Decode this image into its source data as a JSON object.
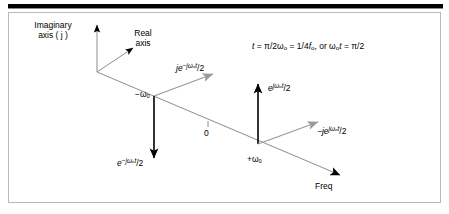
{
  "figure": {
    "title_bar": "",
    "axes": {
      "imaginary_axis_line1": "Imaginary",
      "imaginary_axis_line2": "axis ( j )",
      "real_axis_line1": "Real",
      "real_axis_line2": "axis",
      "freq_axis_label": "Freq"
    },
    "annotation": {
      "equation": "t = π/2ωₒ = 1/4fₒ, or ωₒt = π/2",
      "eq_part_1": "t",
      "eq_part_2": " = π/2ω",
      "eq_sub_1": "o",
      "eq_part_3": " = 1/4",
      "eq_part_4": "f",
      "eq_sub_2": "o",
      "eq_part_5": ", or  ω",
      "eq_sub_3": "o",
      "eq_part_6": "t",
      "eq_part_7": " = π/2"
    },
    "points": {
      "origin_label": "0",
      "negative_freq_label": "−ωₒ",
      "positive_freq_label": "+ωₒ"
    },
    "phasors": [
      {
        "name": "je^(-jωₒt)/2",
        "base": "je",
        "exponent": "−jωₒt",
        "tail": "/2",
        "color": "#9a9a9a",
        "direction": "up-right",
        "at": "-ωₒ"
      },
      {
        "name": "e^(-jωₒt)/2",
        "base": "e",
        "exponent": "−jωₒt",
        "tail": "/2",
        "color": "#000000",
        "direction": "down",
        "at": "-ωₒ"
      },
      {
        "name": "e^(jωₒt)/2",
        "base": "e",
        "exponent": "jωₒt",
        "tail": "/2",
        "color": "#000000",
        "direction": "up",
        "at": "+ωₒ"
      },
      {
        "name": "-je^(jωₒt)/2",
        "base": "−je",
        "exponent": "jωₒt",
        "tail": "/2",
        "color": "#9a9a9a",
        "direction": "up-right",
        "at": "+ωₒ"
      }
    ],
    "colors": {
      "axis_line": "#8d8d8d",
      "black_arrow": "#000000",
      "gray_arrow": "#9a9a9a",
      "frame_border": "#b9b9b9",
      "top_rule": "#000000",
      "background": "#ffffff"
    }
  }
}
